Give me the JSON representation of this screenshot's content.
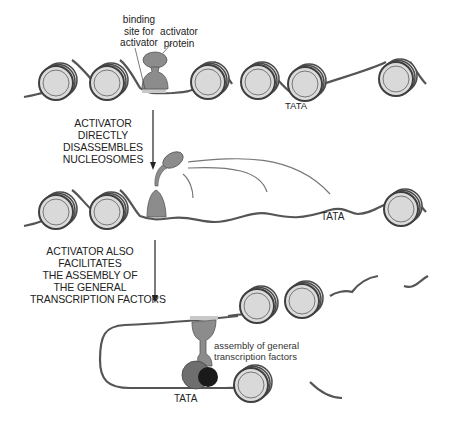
{
  "panels": [
    {
      "id": "panel-1",
      "labels": {
        "binding_site": [
          "binding",
          "site for",
          "activator"
        ],
        "activator_protein": [
          "activator",
          "protein"
        ],
        "tata": "TATA"
      }
    },
    {
      "id": "panel-2",
      "step_caption": [
        "ACTIVATOR",
        "DIRECTLY",
        "DISASSEMBLES",
        "NUCLEOSOMES"
      ],
      "labels": {
        "tata": "TATA"
      }
    },
    {
      "id": "panel-3",
      "step_caption": [
        "ACTIVATOR ALSO",
        "FACILITATES",
        "THE ASSEMBLY OF",
        "THE GENERAL",
        "TRANSCRIPTION FACTORS"
      ],
      "labels": {
        "assembly": [
          "assembly of general",
          "transcription factors"
        ],
        "tata": "TATA"
      }
    }
  ],
  "colors": {
    "dna": "#555555",
    "nucleosome_fill": "#d9d9d9",
    "nucleosome_ring": "#4a4a4a",
    "activator": "#8c8c8c",
    "binding_site": "#c8c8c8",
    "gtf_large": "#6e6e6e",
    "gtf_small": "#1a1a1a"
  }
}
